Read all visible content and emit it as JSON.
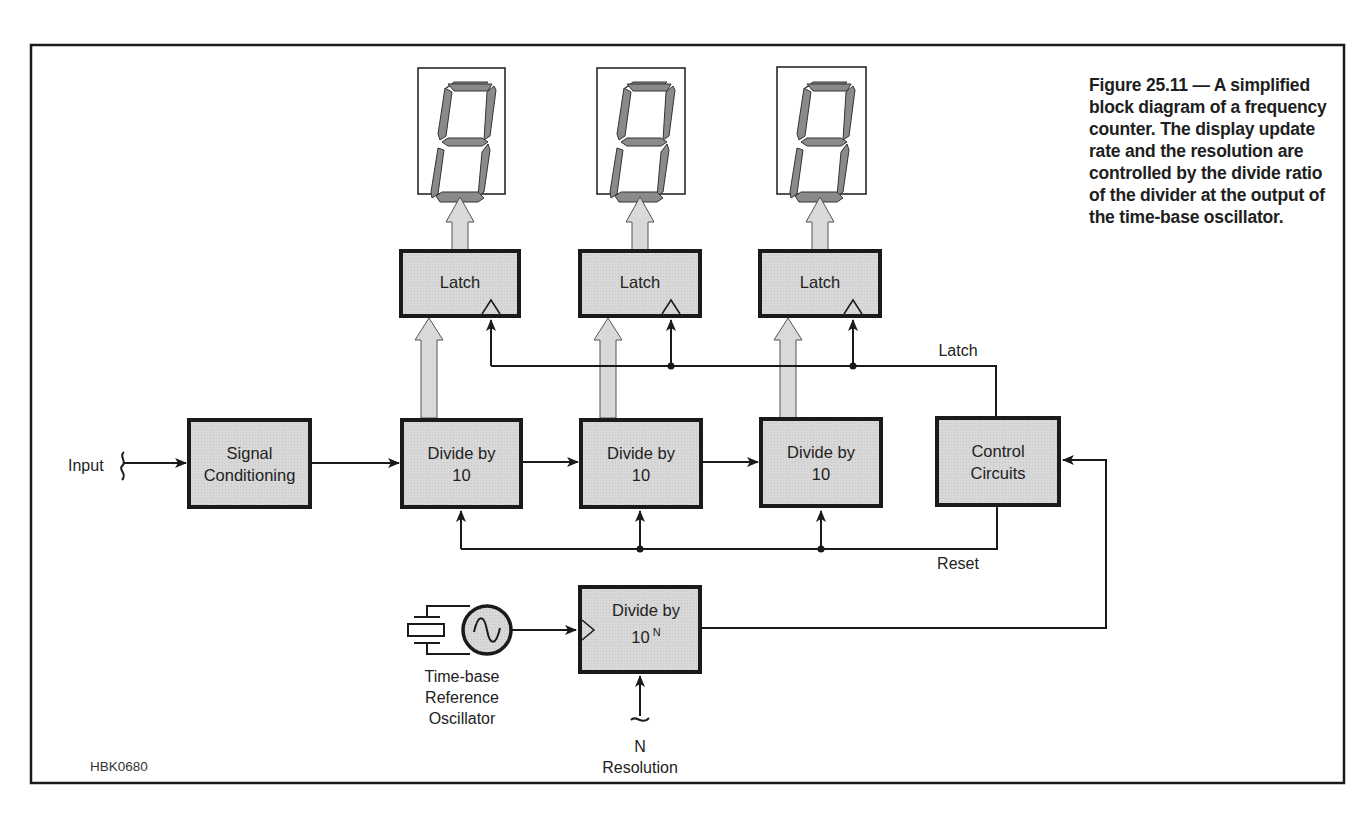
{
  "figure": {
    "caption": "Figure 25.11 — A simplified block diagram of a frequency counter. The display update rate and the resolution are controlled by the divide ratio of the divider at the output of the time-base oscillator.",
    "code": "HBK0680"
  },
  "colors": {
    "block_fill": "#d6d6d6",
    "block_border": "#1a1a1a",
    "segment_fill": "#8a8a8a",
    "bus_arrow_fill": "#d9d9d9",
    "line": "#1a1a1a"
  },
  "input": {
    "label": "Input"
  },
  "blocks": {
    "signal_conditioning": {
      "line1": "Signal",
      "line2": "Conditioning"
    },
    "dividers": [
      {
        "line1": "Divide by",
        "line2": "10"
      },
      {
        "line1": "Divide by",
        "line2": "10"
      },
      {
        "line1": "Divide by",
        "line2": "10"
      }
    ],
    "latches": [
      {
        "label": "Latch"
      },
      {
        "label": "Latch"
      },
      {
        "label": "Latch"
      }
    ],
    "control": {
      "line1": "Control",
      "line2": "Circuits"
    },
    "divide_n": {
      "line1": "Divide by",
      "line2": "10",
      "exponent": "N"
    }
  },
  "displays": [
    {
      "digit": "8",
      "type": "seven-segment"
    },
    {
      "digit": "8",
      "type": "seven-segment"
    },
    {
      "digit": "8",
      "type": "seven-segment"
    }
  ],
  "signals": {
    "latch": "Latch",
    "reset": "Reset"
  },
  "oscillator": {
    "line1": "Time-base",
    "line2": "Reference",
    "line3": "Oscillator"
  },
  "resolution": {
    "line1": "N",
    "line2": "Resolution"
  }
}
